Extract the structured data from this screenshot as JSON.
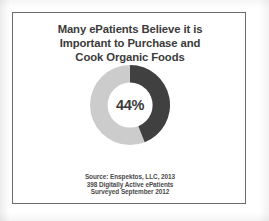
{
  "slide": {
    "title_lines": [
      "Many ePatients Believe it is",
      "Important to Purchase and",
      "Cook Organic Foods"
    ],
    "source_lines": [
      "Source: Enspektos, LLC, 2013",
      "398 Digitally Active ePatients",
      "Surveyed September 2012"
    ],
    "center_value": "44%",
    "border_color": "#6b6b6b",
    "background_color": "#ffffff",
    "text_color": "#3b3b3b"
  },
  "chart_data": {
    "type": "pie",
    "variant": "donut",
    "title": "Many ePatients Believe it is Important to Purchase and Cook Organic Foods",
    "categories": [
      "Believe it is important",
      "Other"
    ],
    "values": [
      44,
      56
    ],
    "unit": "%",
    "colors": [
      "#404040",
      "#cccccc"
    ],
    "data_labels": [
      "44%",
      ""
    ],
    "center_label": "44%",
    "start_angle": 0,
    "direction": "clockwise",
    "hole_ratio": 0.56,
    "legend": false,
    "grid": false,
    "xlabel": "",
    "ylabel": ""
  }
}
